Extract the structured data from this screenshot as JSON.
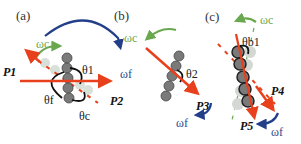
{
  "colors": {
    "red": "#e8401c",
    "blue": "#243f8a",
    "green": "#6aa84f",
    "body": "#7a7a7a",
    "ghost": "#cfd6cf"
  },
  "panels": [
    {
      "label": "(a)",
      "omega_c": "ωc",
      "omega_f": "ωf",
      "forces": [
        "P1",
        "P2"
      ],
      "angles": [
        "θ1",
        "θf",
        "θc"
      ]
    },
    {
      "label": "(b)",
      "omega_c": "ωc",
      "omega_f": "ωf",
      "forces": [
        "P3"
      ],
      "angles": [
        "θ2"
      ]
    },
    {
      "label": "(c)",
      "omega_c": "ωc",
      "omega_f": "ωf",
      "forces": [
        "P4",
        "P5"
      ],
      "angles": [
        "θb1"
      ]
    }
  ]
}
